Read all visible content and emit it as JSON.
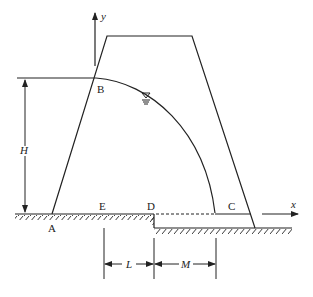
{
  "diagram": {
    "axes": {
      "x_label": "x",
      "y_label": "y"
    },
    "points": {
      "A": "A",
      "B": "B",
      "C": "C",
      "D": "D",
      "E": "E"
    },
    "dimensions": {
      "H": "H",
      "L": "L",
      "M": "M"
    },
    "symbols": {
      "water_surface": "water-level-symbol"
    }
  }
}
